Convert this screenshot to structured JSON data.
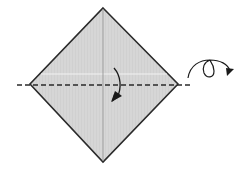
{
  "diagram": {
    "type": "origami-step",
    "colors": {
      "background": "#ffffff",
      "paper_fill": "#d6d6d6",
      "paper_stroke": "#2a2a2a",
      "crease": "#9a9a9a",
      "highlight": "#f0f0f0",
      "fold_line": "#2a2a2a",
      "arrow": "#1a1a1a"
    },
    "paper": {
      "shape": "diamond",
      "vertices": {
        "top": [
          103,
          8
        ],
        "right": [
          178,
          84
        ],
        "bottom": [
          103,
          162
        ],
        "left": [
          30,
          84
        ]
      }
    },
    "creases": [
      {
        "name": "vertical-center-crease",
        "from": [
          103,
          8
        ],
        "to": [
          103,
          162
        ]
      }
    ],
    "fold_line": {
      "name": "horizontal-valley-fold",
      "style": "dashed",
      "from": [
        17,
        85
      ],
      "to": [
        192,
        85
      ]
    },
    "symbols": [
      {
        "name": "fold-down-arrow",
        "meaning": "fold top half down"
      },
      {
        "name": "turn-over-arrow",
        "meaning": "turn the model over"
      }
    ]
  }
}
